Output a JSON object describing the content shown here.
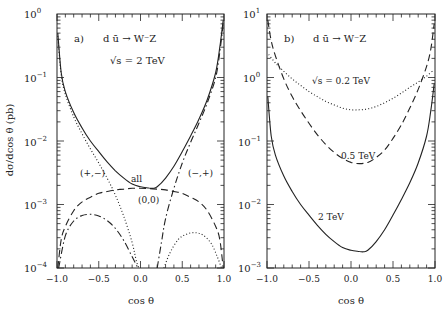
{
  "chart_data": [
    {
      "type": "line",
      "panel": "a)",
      "title": "d ū → W⁻Z",
      "subtitle": "√s = 2 TeV",
      "xlabel": "cos θ",
      "ylabel": "dσ/dcos θ (pb)",
      "xlim": [
        -1.0,
        1.0
      ],
      "ylim": [
        0.0001,
        1
      ],
      "yscale": "log",
      "xticks": [
        "-1.0",
        "-0.5",
        "0.0",
        "0.5",
        "1.0"
      ],
      "yticks": [
        "10^0",
        "10^-1",
        "10^-2",
        "10^-3",
        "10^-4"
      ],
      "annotations": [
        "all",
        "(+,-)",
        "(-,+)",
        "(0,0)"
      ],
      "series": [
        {
          "name": "all",
          "style": "solid",
          "x": [
            -0.99,
            -0.95,
            -0.9,
            -0.8,
            -0.7,
            -0.6,
            -0.5,
            -0.4,
            -0.3,
            -0.2,
            -0.1,
            0.0,
            0.1,
            0.15,
            0.2,
            0.3,
            0.4,
            0.5,
            0.6,
            0.7,
            0.8,
            0.9,
            0.95,
            0.99
          ],
          "y": [
            0.5,
            0.12,
            0.06,
            0.028,
            0.016,
            0.01,
            0.0068,
            0.0047,
            0.0034,
            0.0026,
            0.0021,
            0.0019,
            0.00182,
            0.0018,
            0.0019,
            0.0026,
            0.004,
            0.0068,
            0.012,
            0.022,
            0.045,
            0.12,
            0.3,
            0.8
          ]
        },
        {
          "name": "(+,-)",
          "style": "dotted",
          "x": [
            -0.99,
            -0.95,
            -0.9,
            -0.8,
            -0.7,
            -0.6,
            -0.5,
            -0.4,
            -0.3,
            -0.2,
            -0.1,
            -0.05,
            -0.02
          ],
          "y": [
            0.45,
            0.11,
            0.055,
            0.024,
            0.013,
            0.0075,
            0.0045,
            0.0026,
            0.0014,
            0.00065,
            0.00025,
            0.00013,
            0.0001
          ]
        },
        {
          "name": "(-,+) dotted",
          "style": "dotted",
          "x": [
            0.28,
            0.35,
            0.45,
            0.55,
            0.65,
            0.75,
            0.85,
            0.92,
            0.97
          ],
          "y": [
            0.0001,
            0.00017,
            0.00028,
            0.00034,
            0.00036,
            0.00033,
            0.00024,
            0.00015,
            0.0001
          ]
        },
        {
          "name": "(-,+)",
          "style": "dashdot",
          "x": [
            0.2,
            0.25,
            0.3,
            0.4,
            0.5,
            0.6,
            0.7,
            0.8,
            0.9,
            0.95,
            0.99
          ],
          "y": [
            0.0001,
            0.00025,
            0.0006,
            0.0018,
            0.0045,
            0.0095,
            0.019,
            0.04,
            0.1,
            0.25,
            0.7
          ]
        },
        {
          "name": "(+,-) dashdot",
          "style": "dashdot",
          "x": [
            -0.98,
            -0.9,
            -0.8,
            -0.7,
            -0.6,
            -0.5,
            -0.4,
            -0.3,
            -0.2,
            -0.1,
            -0.03
          ],
          "y": [
            0.0001,
            0.00032,
            0.00055,
            0.00067,
            0.0007,
            0.00066,
            0.00056,
            0.00042,
            0.00027,
            0.00015,
            0.0001
          ]
        },
        {
          "name": "(0,0)",
          "style": "dashed",
          "x": [
            -0.99,
            -0.95,
            -0.9,
            -0.8,
            -0.7,
            -0.6,
            -0.5,
            -0.4,
            -0.3,
            -0.2,
            -0.1,
            0.0,
            0.1,
            0.2,
            0.3,
            0.4,
            0.5,
            0.6,
            0.7,
            0.8,
            0.9,
            0.95,
            0.99
          ],
          "y": [
            0.0001,
            0.00028,
            0.00045,
            0.0008,
            0.0011,
            0.0013,
            0.0015,
            0.0016,
            0.0017,
            0.00175,
            0.0018,
            0.0018,
            0.00178,
            0.00175,
            0.0017,
            0.0016,
            0.0015,
            0.0013,
            0.0011,
            0.0008,
            0.00045,
            0.00028,
            0.0001
          ]
        }
      ]
    },
    {
      "type": "line",
      "panel": "b)",
      "title": "d ū → W⁻Z",
      "xlabel": "cos θ",
      "ylabel": "",
      "xlim": [
        -1.0,
        1.0
      ],
      "ylim": [
        0.001,
        10
      ],
      "yscale": "log",
      "xticks": [
        "-1.0",
        "-0.5",
        "0.0",
        "0.5",
        "1.0"
      ],
      "yticks": [
        "10^1",
        "10^0",
        "10^-1",
        "10^-2",
        "10^-3"
      ],
      "annotations": [
        "√s = 0.2 TeV",
        "0.5 TeV",
        "2 TeV"
      ],
      "series": [
        {
          "name": "√s = 0.2 TeV",
          "style": "dotted",
          "x": [
            -0.98,
            -0.9,
            -0.8,
            -0.7,
            -0.6,
            -0.5,
            -0.4,
            -0.3,
            -0.2,
            -0.1,
            0.0,
            0.1,
            0.2,
            0.3,
            0.4,
            0.5,
            0.6,
            0.7,
            0.8,
            0.9,
            0.98
          ],
          "y": [
            2.3,
            1.7,
            1.25,
            0.95,
            0.75,
            0.6,
            0.5,
            0.42,
            0.37,
            0.33,
            0.31,
            0.31,
            0.32,
            0.35,
            0.4,
            0.47,
            0.57,
            0.7,
            0.85,
            1.05,
            1.3
          ]
        },
        {
          "name": "0.5 TeV",
          "style": "dashed",
          "x": [
            -0.99,
            -0.95,
            -0.9,
            -0.8,
            -0.7,
            -0.6,
            -0.5,
            -0.4,
            -0.3,
            -0.2,
            -0.1,
            0.0,
            0.1,
            0.2,
            0.3,
            0.4,
            0.5,
            0.6,
            0.7,
            0.8,
            0.9,
            0.95,
            0.99
          ],
          "y": [
            8,
            3.8,
            2.2,
            0.95,
            0.5,
            0.3,
            0.19,
            0.125,
            0.088,
            0.066,
            0.053,
            0.046,
            0.044,
            0.046,
            0.055,
            0.072,
            0.11,
            0.18,
            0.33,
            0.65,
            1.5,
            2.8,
            7
          ]
        },
        {
          "name": "2 TeV",
          "style": "solid",
          "x": [
            -0.99,
            -0.95,
            -0.9,
            -0.8,
            -0.7,
            -0.6,
            -0.5,
            -0.4,
            -0.3,
            -0.2,
            -0.1,
            0.0,
            0.1,
            0.15,
            0.2,
            0.3,
            0.4,
            0.5,
            0.6,
            0.7,
            0.8,
            0.9,
            0.95,
            0.99
          ],
          "y": [
            0.5,
            0.12,
            0.06,
            0.028,
            0.016,
            0.01,
            0.0068,
            0.0047,
            0.0034,
            0.0026,
            0.0021,
            0.0019,
            0.00182,
            0.0018,
            0.0019,
            0.0026,
            0.004,
            0.0068,
            0.012,
            0.022,
            0.045,
            0.12,
            0.3,
            0.8
          ]
        }
      ]
    }
  ],
  "panels": {
    "a": {
      "label": "a)",
      "process": "d ū → W⁻Z",
      "energy": "√s = 2 TeV",
      "ytick_bases": [
        "10",
        "10",
        "10",
        "10",
        "10"
      ],
      "ytick_exps": [
        "0",
        "−1",
        "−2",
        "−3",
        "−4"
      ],
      "xtick_labels": [
        "−1.0",
        "−0.5",
        "0.0",
        "0.5",
        "1.0"
      ],
      "xlabel": "cos θ",
      "ylabel": "dσ/dcos θ (pb)",
      "ann_all": "all",
      "ann_pm": "(+,−)",
      "ann_mp": "(−,+)",
      "ann_00": "(0,0)"
    },
    "b": {
      "label": "b)",
      "process": "d ū → W⁻Z",
      "ytick_bases": [
        "10",
        "10",
        "10",
        "10",
        "10"
      ],
      "ytick_exps": [
        "1",
        "0",
        "−1",
        "−2",
        "−3"
      ],
      "xtick_labels": [
        "−1.0",
        "−0.5",
        "0.0",
        "0.5",
        "1.0"
      ],
      "xlabel": "cos θ",
      "ann_02": "√s = 0.2 TeV",
      "ann_05": "0.5 TeV",
      "ann_2": "2 TeV"
    }
  }
}
